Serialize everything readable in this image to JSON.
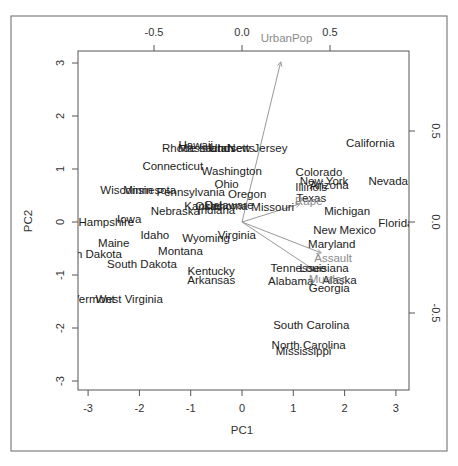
{
  "chart_data": {
    "type": "scatter",
    "subtype": "biplot",
    "title": "",
    "xlabel": "PC1",
    "ylabel": "PC2",
    "xlim": [
      -3.2,
      3.2
    ],
    "ylim": [
      -3.2,
      3.2
    ],
    "x_ticks": [
      -3,
      -2,
      -1,
      0,
      1,
      2,
      3
    ],
    "y_ticks": [
      -3,
      -2,
      -1,
      0,
      1,
      2,
      3
    ],
    "top_axis_ticks": [
      "-0.5",
      "0.0",
      "0.5"
    ],
    "right_axis_ticks": [
      "0.5",
      "0.0",
      "-0.5"
    ],
    "grid": false,
    "legend": null,
    "points": [
      {
        "label": "Hawaii",
        "x": -0.9,
        "y": 1.45
      },
      {
        "label": "Rhode Island",
        "x": -0.9,
        "y": 1.4
      },
      {
        "label": "Massachusetts",
        "x": -0.5,
        "y": 1.4
      },
      {
        "label": "Utah",
        "x": -0.4,
        "y": 1.4
      },
      {
        "label": "New Jersey",
        "x": 0.3,
        "y": 1.4
      },
      {
        "label": "Connecticut",
        "x": -1.35,
        "y": 1.05
      },
      {
        "label": "Washington",
        "x": -0.2,
        "y": 0.97
      },
      {
        "label": "Ohio",
        "x": -0.3,
        "y": 0.72
      },
      {
        "label": "Oregon",
        "x": 0.1,
        "y": 0.52
      },
      {
        "label": "Pennsylvania",
        "x": -1.0,
        "y": 0.57
      },
      {
        "label": "Wisconsin",
        "x": -2.25,
        "y": 0.6
      },
      {
        "label": "Minnesota",
        "x": -1.8,
        "y": 0.6
      },
      {
        "label": "Colorado",
        "x": 1.5,
        "y": 0.95
      },
      {
        "label": "New York",
        "x": 1.6,
        "y": 0.78
      },
      {
        "label": "Arizona",
        "x": 1.7,
        "y": 0.7
      },
      {
        "label": "Illinois",
        "x": 1.35,
        "y": 0.66
      },
      {
        "label": "California",
        "x": 2.5,
        "y": 1.5
      },
      {
        "label": "Nevada",
        "x": 2.85,
        "y": 0.77
      },
      {
        "label": "Texas",
        "x": 1.35,
        "y": 0.45
      },
      {
        "label": "Missouri",
        "x": 0.6,
        "y": 0.28
      },
      {
        "label": "Delaware",
        "x": -0.25,
        "y": 0.33
      },
      {
        "label": "Oklahoma",
        "x": -0.4,
        "y": 0.3
      },
      {
        "label": "Kansas",
        "x": -0.75,
        "y": 0.3
      },
      {
        "label": "Indiana",
        "x": -0.5,
        "y": 0.22
      },
      {
        "label": "Nebraska",
        "x": -1.3,
        "y": 0.2
      },
      {
        "label": "Michigan",
        "x": 2.05,
        "y": 0.2
      },
      {
        "label": "Florida",
        "x": 3.0,
        "y": -0.02
      },
      {
        "label": "New Mexico",
        "x": 2.0,
        "y": -0.15
      },
      {
        "label": "New Hampshire",
        "x": -2.9,
        "y": 0.0
      },
      {
        "label": "Iowa",
        "x": -2.2,
        "y": 0.05
      },
      {
        "label": "Idaho",
        "x": -1.7,
        "y": -0.25
      },
      {
        "label": "Wyoming",
        "x": -0.7,
        "y": -0.3
      },
      {
        "label": "Virginia",
        "x": -0.1,
        "y": -0.25
      },
      {
        "label": "Maryland",
        "x": 1.75,
        "y": -0.42
      },
      {
        "label": "Maine",
        "x": -2.5,
        "y": -0.4
      },
      {
        "label": "North Dakota",
        "x": -3.0,
        "y": -0.6
      },
      {
        "label": "Montana",
        "x": -1.2,
        "y": -0.55
      },
      {
        "label": "South Dakota",
        "x": -1.95,
        "y": -0.8
      },
      {
        "label": "Kentucky",
        "x": -0.6,
        "y": -0.92
      },
      {
        "label": "Arkansas",
        "x": -0.6,
        "y": -1.1
      },
      {
        "label": "Tennessee",
        "x": 1.1,
        "y": -0.87
      },
      {
        "label": "Louisiana",
        "x": 1.6,
        "y": -0.87
      },
      {
        "label": "Alabama",
        "x": 0.95,
        "y": -1.12
      },
      {
        "label": "Alaska",
        "x": 1.9,
        "y": -1.1
      },
      {
        "label": "Georgia",
        "x": 1.7,
        "y": -1.25
      },
      {
        "label": "Vermont",
        "x": -2.9,
        "y": -1.45
      },
      {
        "label": "West Virginia",
        "x": -2.2,
        "y": -1.45
      },
      {
        "label": "South Carolina",
        "x": 1.35,
        "y": -1.95
      },
      {
        "label": "North Carolina",
        "x": 1.3,
        "y": -2.32
      },
      {
        "label": "Mississippi",
        "x": 1.2,
        "y": -2.44
      }
    ],
    "loadings": [
      {
        "label": "UrbanPop",
        "x": 0.22,
        "y": 0.88
      },
      {
        "label": "Rape",
        "x": 0.33,
        "y": 0.1
      },
      {
        "label": "Assault",
        "x": 0.45,
        "y": -0.17
      },
      {
        "label": "Murder",
        "x": 0.42,
        "y": -0.27
      }
    ]
  },
  "axes": {
    "xlabel": "PC1",
    "ylabel": "PC2",
    "bottom_ticks": [
      "-3",
      "-2",
      "-1",
      "0",
      "1",
      "2",
      "3"
    ],
    "left_ticks": [
      "3",
      "2",
      "1",
      "0",
      "-1",
      "-2",
      "-3"
    ],
    "top_ticks": [
      "-0.5",
      "0.0",
      "0.5"
    ],
    "right_ticks": [
      "0.5",
      "0.0",
      "-0.5"
    ]
  },
  "colors": {
    "point_label": "#222222",
    "variable_label": "#8a8a8a",
    "arrow": "#999999",
    "frame": "#555555"
  }
}
